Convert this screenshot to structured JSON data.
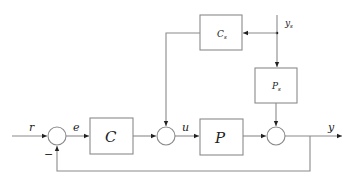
{
  "diagram": {
    "title": "",
    "colors": {
      "line": "#8a8a8a",
      "text": "#222222",
      "background": "#ffffff"
    },
    "blocks": {
      "C": {
        "label": "C",
        "sub": ""
      },
      "P": {
        "label": "P",
        "sub": ""
      },
      "Cs": {
        "label": "C",
        "sub": "s"
      },
      "Ps": {
        "label": "P",
        "sub": "s"
      }
    },
    "signals": {
      "r": "r",
      "e": "e",
      "u": "u",
      "y": "y",
      "ys": {
        "label": "y",
        "sub": "s"
      }
    },
    "sign_labels": {
      "feedback_minus": "−"
    },
    "summing_junctions": [
      "sum-error",
      "sum-control",
      "sum-output"
    ]
  }
}
